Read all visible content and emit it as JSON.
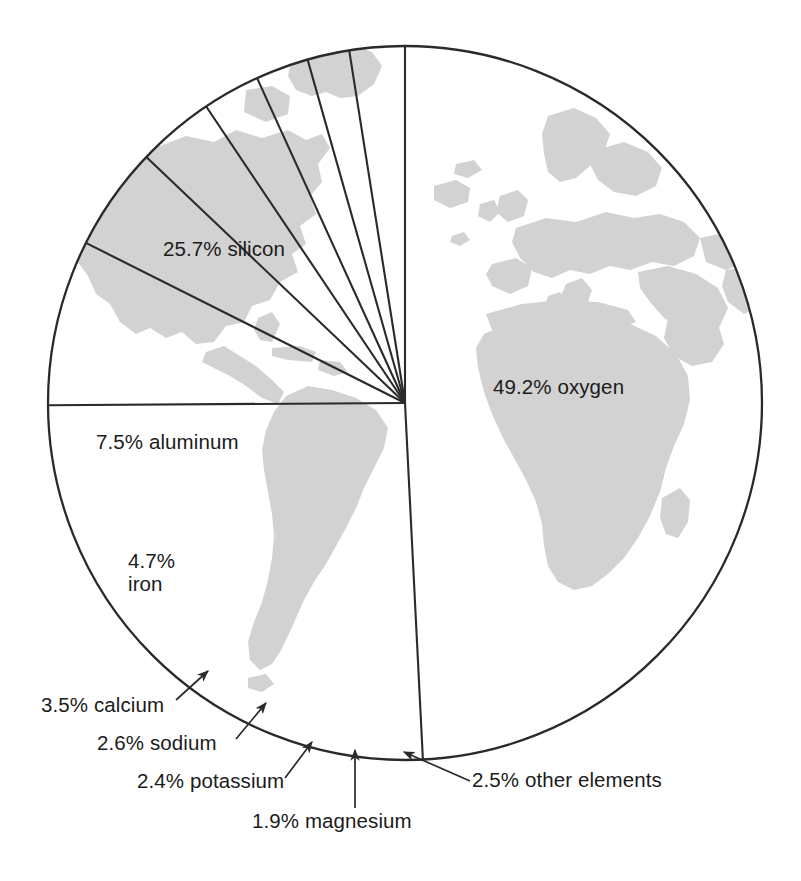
{
  "figure": {
    "kind": "pie-chart-over-world-map",
    "background_color": "#ffffff",
    "land_fill_color": "#d2d2d2",
    "ocean_fill_color": "#ffffff",
    "outline_color": "#2a2a2a",
    "text_color": "#1b1b1b"
  },
  "labels": {
    "silicon": "25.7% silicon",
    "oxygen": "49.2% oxygen",
    "aluminum": "7.5% aluminum",
    "iron_line1": "4.7%",
    "iron_line2": "iron",
    "calcium": "3.5% calcium",
    "sodium": "2.6% sodium",
    "potassium": "2.4% potassium",
    "magnesium": "1.9% magnesium",
    "other": "2.5% other elements"
  },
  "chart_data": {
    "type": "pie",
    "title": "",
    "subtitle": "",
    "xlabel": "",
    "ylabel": "",
    "grid": false,
    "legend_position": "callout-labels",
    "units": "percent",
    "total": 100.0,
    "start_angle_deg": 0,
    "direction": "clockwise",
    "categories": [
      "oxygen",
      "silicon",
      "aluminum",
      "iron",
      "calcium",
      "sodium",
      "potassium",
      "magnesium",
      "other elements"
    ],
    "values": [
      49.2,
      25.7,
      7.5,
      4.7,
      3.5,
      2.6,
      2.4,
      1.9,
      2.5
    ],
    "slices": [
      {
        "name": "oxygen",
        "value": 49.2,
        "label": "49.2% oxygen",
        "label_placement": "inside"
      },
      {
        "name": "silicon",
        "value": 25.7,
        "label": "25.7% silicon",
        "label_placement": "inside"
      },
      {
        "name": "aluminum",
        "value": 7.5,
        "label": "7.5% aluminum",
        "label_placement": "inside"
      },
      {
        "name": "iron",
        "value": 4.7,
        "label": "4.7% iron",
        "label_placement": "inside"
      },
      {
        "name": "calcium",
        "value": 3.5,
        "label": "3.5% calcium",
        "label_placement": "callout-arrow"
      },
      {
        "name": "sodium",
        "value": 2.6,
        "label": "2.6% sodium",
        "label_placement": "callout-arrow"
      },
      {
        "name": "potassium",
        "value": 2.4,
        "label": "2.4% potassium",
        "label_placement": "callout-arrow"
      },
      {
        "name": "magnesium",
        "value": 1.9,
        "label": "1.9% magnesium",
        "label_placement": "callout-arrow"
      },
      {
        "name": "other elements",
        "value": 2.5,
        "label": "2.5% other elements",
        "label_placement": "callout-arrow"
      }
    ]
  }
}
